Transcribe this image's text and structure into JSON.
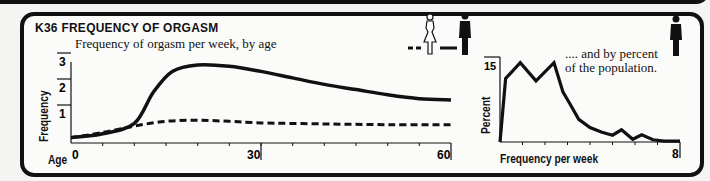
{
  "header": {
    "code": "K36",
    "title": "FREQUENCY OF ORGASM",
    "subtitle": "Frequency of orgasm per week, by age",
    "right_subtitle_line1": ".... and by percent",
    "right_subtitle_line2": "of the population."
  },
  "legend": {
    "female": {
      "label": "female",
      "style": "dashed",
      "icon": "female-figure-outline-icon"
    },
    "male": {
      "label": "male",
      "style": "solid",
      "icon": "male-figure-solid-icon"
    }
  },
  "chart_data": [
    {
      "type": "line",
      "title": "Frequency of orgasm per week, by age",
      "xlabel": "Age",
      "ylabel": "Frequency",
      "xlim": [
        0,
        60
      ],
      "ylim": [
        0,
        3
      ],
      "x_ticks": [
        0,
        30,
        60
      ],
      "x_tick_labels": [
        "0",
        "30",
        "60"
      ],
      "y_ticks": [
        1,
        2,
        3
      ],
      "y_tick_labels": [
        "1",
        "2",
        "3"
      ],
      "series": [
        {
          "name": "male",
          "style": "solid",
          "x": [
            0,
            5,
            10,
            13,
            16,
            20,
            25,
            30,
            35,
            40,
            45,
            50,
            55,
            60
          ],
          "values": [
            0.05,
            0.2,
            0.6,
            1.8,
            2.6,
            2.85,
            2.8,
            2.6,
            2.35,
            2.1,
            1.9,
            1.7,
            1.55,
            1.5
          ]
        },
        {
          "name": "female",
          "style": "dashed",
          "x": [
            0,
            5,
            10,
            15,
            20,
            25,
            30,
            40,
            50,
            60
          ],
          "values": [
            0.05,
            0.25,
            0.5,
            0.68,
            0.72,
            0.68,
            0.62,
            0.58,
            0.55,
            0.55
          ]
        }
      ]
    },
    {
      "type": "line",
      "title": "and by percent of the population",
      "xlabel": "Frequency per week",
      "ylabel": "Percent",
      "xlim": [
        0,
        8
      ],
      "ylim": [
        0,
        15
      ],
      "x_tick_labels": [
        "8"
      ],
      "y_tick_labels": [
        "15"
      ],
      "series": [
        {
          "name": "male",
          "style": "solid",
          "x": [
            0,
            0.25,
            0.9,
            1.6,
            2.4,
            2.8,
            3.1,
            3.5,
            4.0,
            4.5,
            5.0,
            5.4,
            5.9,
            6.3,
            6.8,
            7.3,
            8.0
          ],
          "values": [
            0,
            14,
            17.5,
            13.5,
            17.5,
            11,
            8.5,
            5,
            3.2,
            2.2,
            1.5,
            2.7,
            0.6,
            1.6,
            0.5,
            0.2,
            0.2
          ]
        }
      ]
    }
  ]
}
